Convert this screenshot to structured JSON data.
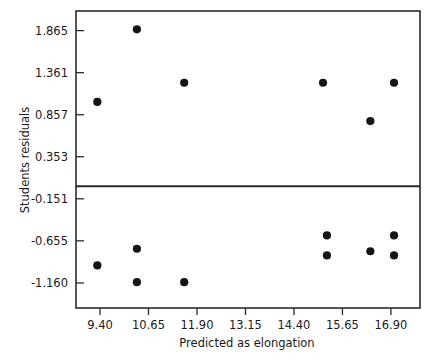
{
  "chart_data": {
    "type": "scatter",
    "title": "",
    "xlabel": "Predicted as elongation",
    "ylabel": "Students residuals",
    "xlim": [
      8.78,
      17.65
    ],
    "ylim": [
      -1.46,
      2.1
    ],
    "xticks": [
      9.4,
      10.65,
      11.9,
      13.15,
      14.4,
      15.65,
      16.9
    ],
    "xticklabels": [
      "9.40",
      "10.65",
      "11.90",
      "13.15",
      "14.40",
      "15.65",
      "16.90"
    ],
    "yticks": [
      1.865,
      1.361,
      0.857,
      0.353,
      -0.151,
      -0.655,
      -1.16
    ],
    "yticklabels": [
      "1.865",
      "1.361",
      "0.857",
      "0.353",
      "-0.151",
      "-0.655",
      "-1.160"
    ],
    "grid": false,
    "legend": null,
    "reference_line": {
      "orientation": "horizontal",
      "y": 0.0
    },
    "x": [
      9.33,
      10.35,
      11.57,
      15.15,
      16.37,
      16.98,
      9.33,
      10.35,
      10.35,
      11.57,
      15.25,
      15.25,
      16.37,
      16.98,
      16.98
    ],
    "y": [
      1.01,
      1.88,
      1.24,
      1.24,
      0.78,
      1.24,
      -0.95,
      -0.75,
      -1.15,
      -1.15,
      -0.59,
      -0.83,
      -0.78,
      -0.59,
      -0.83
    ],
    "points": [
      {
        "x": 9.33,
        "y": 1.01
      },
      {
        "x": 10.35,
        "y": 1.88
      },
      {
        "x": 11.57,
        "y": 1.24
      },
      {
        "x": 15.15,
        "y": 1.24
      },
      {
        "x": 16.37,
        "y": 0.78
      },
      {
        "x": 16.98,
        "y": 1.24
      },
      {
        "x": 9.33,
        "y": -0.95
      },
      {
        "x": 10.35,
        "y": -0.75
      },
      {
        "x": 10.35,
        "y": -1.15
      },
      {
        "x": 11.57,
        "y": -1.15
      },
      {
        "x": 15.25,
        "y": -0.59
      },
      {
        "x": 15.25,
        "y": -0.83
      },
      {
        "x": 16.37,
        "y": -0.78
      },
      {
        "x": 16.98,
        "y": -0.59
      },
      {
        "x": 16.98,
        "y": -0.83
      }
    ],
    "marker": {
      "shape": "circle",
      "size": 4.1,
      "color": "#151515"
    }
  }
}
